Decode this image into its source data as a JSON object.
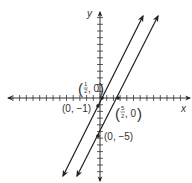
{
  "chart_data": {
    "type": "line",
    "title": "",
    "xlabel": "x",
    "ylabel": "y",
    "xlim": [
      -12,
      12
    ],
    "ylim": [
      -11,
      12
    ],
    "grid": false,
    "axis_ticks": "every 1 unit, unlabeled",
    "series": [
      {
        "name": "y = 2x - 1",
        "slope": 2,
        "intercept": -1,
        "marked_points": [
          {
            "x": 0.5,
            "y": 0,
            "label": "(1/2, 0)"
          },
          {
            "x": 0,
            "y": -1,
            "label": "(0, -1)"
          }
        ]
      },
      {
        "name": "y = 2x - 5",
        "slope": 2,
        "intercept": -5,
        "marked_points": [
          {
            "x": 2.5,
            "y": 0,
            "label": "(5/2, 0)"
          },
          {
            "x": 0,
            "y": -5,
            "label": "(0, -5)"
          }
        ]
      }
    ],
    "annotations": [
      {
        "text": "(1/2, 0)",
        "point": [
          0.5,
          0
        ]
      },
      {
        "text": "(0, −1)",
        "point": [
          0,
          -1
        ]
      },
      {
        "text": "(5/2, 0)",
        "point": [
          2.5,
          0
        ]
      },
      {
        "text": "(0, −5)",
        "point": [
          0,
          -5
        ]
      }
    ]
  },
  "labels": {
    "x_axis": "x",
    "y_axis": "y",
    "p1": {
      "open": "(",
      "num": "1",
      "den": "2",
      "rest": ", 0",
      "close": ")"
    },
    "p2": "(0, −1)",
    "p3": {
      "open": "(",
      "num": "5",
      "den": "2",
      "rest": ", 0",
      "close": ")"
    },
    "p4": "(0, −5)"
  },
  "colors": {
    "ink": "#222222",
    "background": "#ffffff"
  }
}
